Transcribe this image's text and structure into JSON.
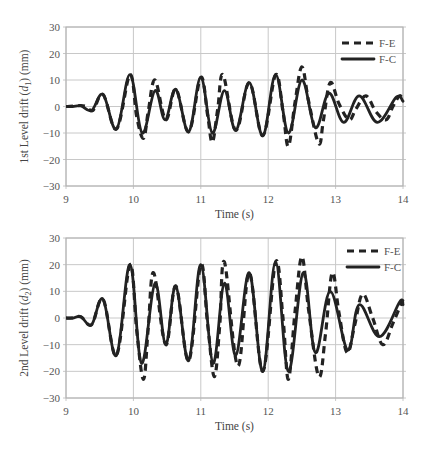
{
  "chart_data": [
    {
      "type": "line",
      "title": "",
      "xlabel": "Time (s)",
      "ylabel": "1st Level drift (d1) (mm)",
      "ylabel_parts": {
        "pre": "1st Level drift (",
        "var": "d",
        "sub": "1",
        "post": ") (mm)"
      },
      "xlim": [
        9,
        14
      ],
      "ylim": [
        -30,
        30
      ],
      "x_ticks": [
        9,
        10,
        11,
        12,
        13,
        14
      ],
      "y_ticks": [
        30,
        20,
        10,
        0,
        -10,
        -20,
        -30
      ],
      "y_tick_labels": [
        "30",
        "20",
        "10",
        "0",
        "−10",
        "−20",
        "−30"
      ],
      "grid": true,
      "legend_position": "upper right",
      "series": [
        {
          "name": "F-E",
          "style": "dashed",
          "x": [
            9.0,
            9.2,
            9.3,
            9.4,
            9.55,
            9.75,
            9.95,
            10.05,
            10.15,
            10.22,
            10.32,
            10.48,
            10.63,
            10.82,
            11.0,
            11.1,
            11.17,
            11.25,
            11.33,
            11.52,
            11.72,
            11.92,
            12.11,
            12.22,
            12.3,
            12.4,
            12.5,
            12.6,
            12.75,
            12.82,
            12.92,
            13.05,
            13.2,
            13.3,
            13.45,
            13.6,
            13.75,
            13.85,
            13.95,
            14.0
          ],
          "values": [
            0,
            0.3,
            0,
            -1.5,
            4.5,
            -8.5,
            12,
            -4,
            -12,
            -2,
            10,
            -5,
            6.5,
            -9.5,
            11,
            -3,
            -13.5,
            -1,
            12,
            -9,
            9,
            -11,
            12,
            -2,
            -15,
            2,
            15,
            2,
            -14,
            -5,
            9,
            1,
            -5,
            -1,
            4,
            -2,
            -5,
            0,
            4,
            2
          ]
        },
        {
          "name": "F-C",
          "style": "solid",
          "x": [
            9.0,
            9.1,
            9.22,
            9.38,
            9.55,
            9.75,
            9.95,
            10.13,
            10.32,
            10.47,
            10.63,
            10.82,
            11.0,
            11.17,
            11.35,
            11.52,
            11.72,
            11.92,
            12.11,
            12.3,
            12.5,
            12.7,
            12.9,
            13.12,
            13.35,
            13.62,
            13.9,
            14.0
          ],
          "values": [
            0,
            0,
            0.3,
            -1.5,
            4.5,
            -8.5,
            12,
            -10,
            6,
            -5,
            6.5,
            -9.5,
            11,
            -10,
            6,
            -9,
            9,
            -11,
            12,
            -10,
            10,
            -8,
            5,
            -6,
            4,
            -6,
            3.5,
            2
          ]
        }
      ]
    },
    {
      "type": "line",
      "title": "",
      "xlabel": "Time (s)",
      "ylabel": "2nd Level drift (d2) (mm)",
      "ylabel_parts": {
        "pre": "2nd Level drift (",
        "var": "d",
        "sub": "2",
        "post": ") (mm)"
      },
      "xlim": [
        9,
        14
      ],
      "ylim": [
        -30,
        30
      ],
      "x_ticks": [
        9,
        10,
        11,
        12,
        13,
        14
      ],
      "y_ticks": [
        30,
        20,
        10,
        0,
        -10,
        -20,
        -30
      ],
      "y_tick_labels": [
        "30",
        "20",
        "10",
        "0",
        "−10",
        "−20",
        "−30"
      ],
      "grid": true,
      "legend_position": "upper right",
      "series": [
        {
          "name": "F-E",
          "style": "dashed",
          "x": [
            9.0,
            9.1,
            9.22,
            9.38,
            9.55,
            9.75,
            9.95,
            10.05,
            10.15,
            10.22,
            10.3,
            10.48,
            10.63,
            10.82,
            11.0,
            11.1,
            11.2,
            11.28,
            11.35,
            11.55,
            11.72,
            11.92,
            12.11,
            12.22,
            12.3,
            12.4,
            12.5,
            12.6,
            12.75,
            12.85,
            12.95,
            13.05,
            13.17,
            13.28,
            13.4,
            13.55,
            13.7,
            13.85,
            14.0
          ],
          "values": [
            0,
            0,
            0.5,
            -2.5,
            7,
            -14,
            20,
            -5,
            -23,
            -4,
            17,
            -10,
            12,
            -16,
            20,
            -2,
            -22,
            -3,
            21,
            -18,
            17,
            -20,
            21,
            0,
            -23,
            3,
            23,
            3,
            -22,
            -6,
            17,
            2,
            -13,
            -3,
            9,
            0,
            -10,
            -2,
            7
          ]
        },
        {
          "name": "F-C",
          "style": "solid",
          "x": [
            9.0,
            9.1,
            9.22,
            9.38,
            9.55,
            9.75,
            9.95,
            10.12,
            10.32,
            10.48,
            10.63,
            10.82,
            11.0,
            11.18,
            11.35,
            11.52,
            11.72,
            11.92,
            12.11,
            12.3,
            12.52,
            12.7,
            12.92,
            13.18,
            13.35,
            13.65,
            13.95,
            14.0
          ],
          "values": [
            0,
            0,
            0.5,
            -2.5,
            7,
            -14,
            20,
            -17,
            13,
            -10,
            12,
            -16,
            20,
            -17,
            13,
            -14,
            17,
            -20,
            21,
            -20,
            17,
            -13,
            10,
            -12,
            5,
            -7,
            6,
            5
          ]
        }
      ]
    }
  ]
}
